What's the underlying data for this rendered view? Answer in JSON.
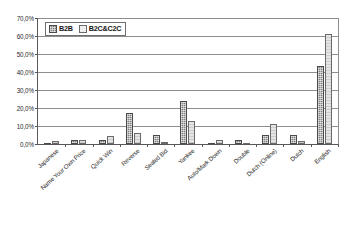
{
  "chart_data": {
    "type": "bar",
    "title": "",
    "xlabel": "",
    "ylabel": "",
    "ylim": [
      0,
      70
    ],
    "ytick_step": 10,
    "ytick_labels": [
      "0,0%",
      "10,0%",
      "20,0%",
      "30,0%",
      "40,0%",
      "50,0%",
      "60,0%",
      "70,0%"
    ],
    "grid": true,
    "legend_position": "top-left inside plot",
    "categories": [
      "Japanese",
      "Name Your Own Price",
      "Quick Win",
      "Reverse",
      "Sealed Bid",
      "Yankee",
      "Auto/Mark Down",
      "Double",
      "Dutch (Online)",
      "Dutch",
      "English"
    ],
    "series": [
      {
        "name": "B2B",
        "color": "#808080",
        "values": [
          0.0,
          2.0,
          2.0,
          17.0,
          5.0,
          24.0,
          0.0,
          2.0,
          5.0,
          5.0,
          43.5
        ]
      },
      {
        "name": "B2C&C2C",
        "color": "#e4e4e4",
        "values": [
          1.5,
          2.5,
          4.5,
          6.0,
          1.0,
          13.0,
          2.0,
          0.0,
          11.0,
          1.5,
          61.0
        ]
      }
    ]
  },
  "legend": {
    "entries": [
      {
        "label": "B2B"
      },
      {
        "label": "B2C&C2C"
      }
    ]
  }
}
